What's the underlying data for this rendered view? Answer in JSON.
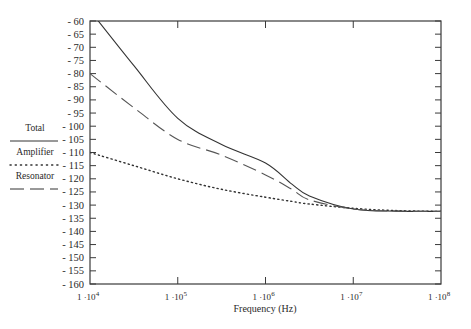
{
  "chart_data": {
    "type": "line",
    "title": "",
    "xlabel": "Frequency (Hz)",
    "ylabel": "",
    "xscale": "log",
    "xlim": [
      10000,
      100000000
    ],
    "ylim": [
      -160,
      -60
    ],
    "x_ticks": [
      {
        "value": 10000,
        "mant": "1 ·10",
        "exp": "4"
      },
      {
        "value": 100000,
        "mant": "1 ·10",
        "exp": "5"
      },
      {
        "value": 1000000,
        "mant": "1 ·10",
        "exp": "6"
      },
      {
        "value": 10000000,
        "mant": "1 ·10",
        "exp": "7"
      },
      {
        "value": 100000000,
        "mant": "1 ·10",
        "exp": "8"
      }
    ],
    "y_ticks": [
      -60,
      -65,
      -70,
      -75,
      -80,
      -85,
      -90,
      -95,
      -100,
      -105,
      -110,
      -115,
      -120,
      -125,
      -130,
      -135,
      -140,
      -145,
      -150,
      -155,
      -160
    ],
    "y_tick_labels": [
      "- 60",
      "- 65",
      "- 70",
      "- 75",
      "- 80",
      "- 85",
      "- 90",
      "- 95",
      "- 100",
      "- 105",
      "- 110",
      "- 115",
      "- 120",
      "- 125",
      "- 130",
      "- 135",
      "- 140",
      "- 145",
      "- 150",
      "- 155",
      "- 160"
    ],
    "grid": false,
    "legend_position": "left",
    "x": [
      10000,
      31623,
      100000,
      316228,
      1000000,
      2000000,
      3162278,
      10000000,
      31622777,
      100000000
    ],
    "series": [
      {
        "name": "Total",
        "style": "solid",
        "color": "#333333",
        "values": [
          -56,
          -77,
          -97,
          -107,
          -114,
          -122,
          -126.5,
          -131.5,
          -132.3,
          -132.4
        ]
      },
      {
        "name": "Amplifier",
        "style": "dotted",
        "color": "#333333",
        "values": [
          -110,
          -115,
          -120,
          -124,
          -127,
          -128.6,
          -129.6,
          -131.2,
          -132.1,
          -132.4
        ]
      },
      {
        "name": "Resonator",
        "style": "dashed",
        "color": "#555555",
        "values": [
          -80,
          -93,
          -105,
          -111,
          -118.5,
          -124,
          -128,
          -131.5,
          -132.3,
          -132.4
        ]
      }
    ]
  },
  "legend": {
    "items": [
      {
        "label": "Total",
        "style": "solid"
      },
      {
        "label": "Amplifier",
        "style": "dotted"
      },
      {
        "label": "Resonator",
        "style": "dashed"
      }
    ]
  }
}
